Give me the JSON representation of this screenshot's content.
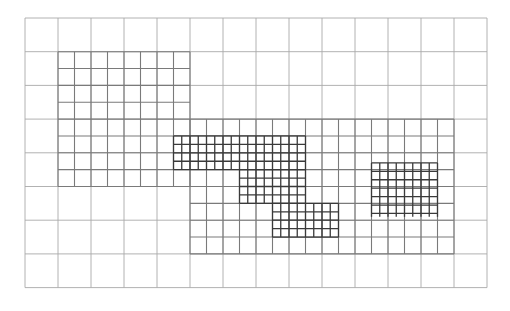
{
  "diagram": {
    "type": "adaptive-mesh-refinement-grid",
    "canvas": {
      "width": 510,
      "height": 311,
      "background": "#ffffff"
    },
    "outer_grid": {
      "level": 0,
      "origin": [
        25,
        18
      ],
      "cols": 14,
      "rows": 8,
      "cell_w": 33,
      "cell_h": 33.7,
      "stroke": "#a9a9a9",
      "stroke_width": 0.9
    },
    "level1_regions": [
      {
        "name": "medium-block-left",
        "col0": 1,
        "row0": 1,
        "col1": 5,
        "row1": 5
      },
      {
        "name": "medium-block-right",
        "col0": 5,
        "row0": 3,
        "col1": 13,
        "row1": 7
      }
    ],
    "level1": {
      "subdivide": 2,
      "stroke": "#7a7a7a",
      "stroke_width": 1.1
    },
    "level2_regions": [
      {
        "name": "fine-block-a",
        "col0": 4.5,
        "row0": 3.5,
        "col1": 8.5,
        "row1": 4.5
      },
      {
        "name": "fine-block-b",
        "col0": 6.5,
        "row0": 4.5,
        "col1": 8.5,
        "row1": 5.5
      },
      {
        "name": "fine-block-c",
        "col0": 7.5,
        "row0": 5.5,
        "col1": 9.5,
        "row1": 6.5
      },
      {
        "name": "fine-block-d",
        "col0": 10.5,
        "row0": 4.3,
        "col1": 12.5,
        "row1": 5.9
      }
    ],
    "level2": {
      "subdivide": 4,
      "stroke": "#3a3a3a",
      "stroke_width": 1.3
    }
  }
}
